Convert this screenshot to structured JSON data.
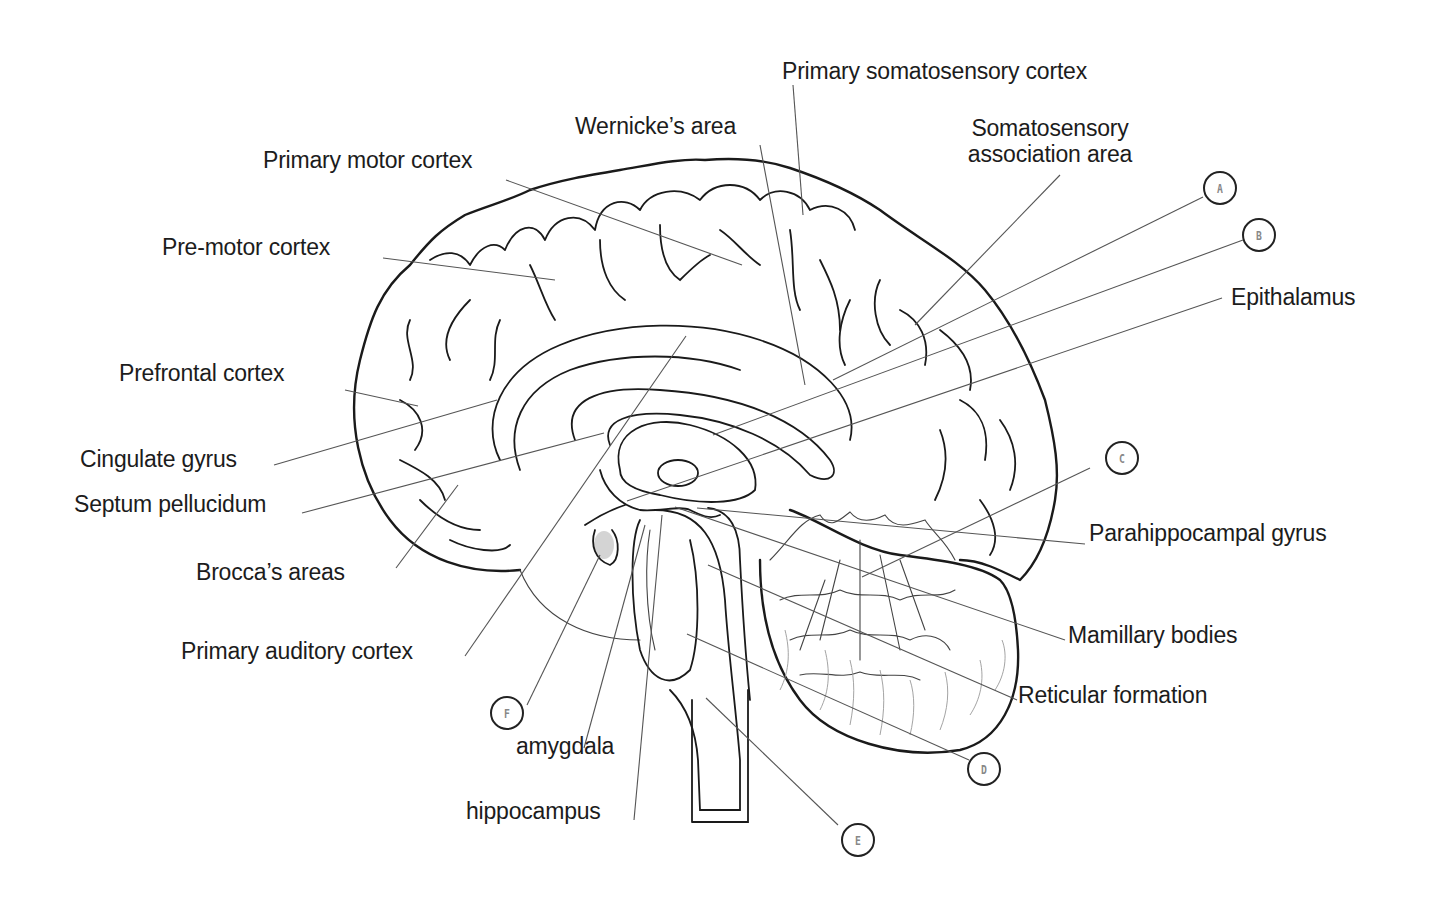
{
  "diagram": {
    "labels": {
      "primary_somatosensory_cortex": "Primary somatosensory cortex",
      "wernickes_area": "Wernicke’s area",
      "somatosensory_association_area_line1": "Somatosensory",
      "somatosensory_association_area_line2": "association area",
      "primary_motor_cortex": "Primary motor cortex",
      "pre_motor_cortex": "Pre-motor cortex",
      "epithalamus": "Epithalamus",
      "prefrontal_cortex": "Prefrontal cortex",
      "cingulate_gyrus": "Cingulate gyrus",
      "septum_pellucidum": "Septum pellucidum",
      "parahippocampal_gyrus": "Parahippocampal gyrus",
      "brocas_areas": "Brocca’s areas",
      "mamillary_bodies": "Mamillary bodies",
      "primary_auditory_cortex": "Primary auditory  cortex",
      "reticular_formation": "Reticular formation",
      "amygdala": "amygdala",
      "hippocampus": "hippocampus"
    },
    "markers": {
      "A": "A",
      "B": "B",
      "C": "C",
      "D": "D",
      "E": "E",
      "F": "F"
    },
    "colors": {
      "line": "#1a1a1a",
      "leader": "#555555",
      "marker_text": "#888888",
      "background": "#ffffff"
    }
  }
}
